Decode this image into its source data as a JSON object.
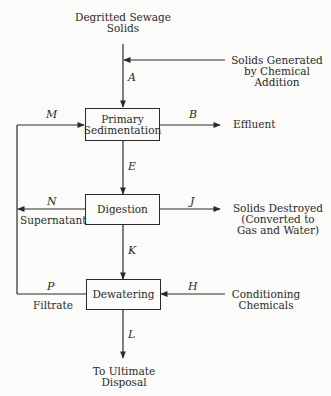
{
  "diagram": {
    "type": "process-flow",
    "inputs": {
      "sewage_solids": [
        "Degritted Sewage",
        "Solids"
      ],
      "chemical_solids": [
        "Solids Generated",
        "by Chemical",
        "Addition"
      ],
      "conditioning": [
        "Conditioning",
        "Chemicals"
      ]
    },
    "processes": {
      "primary_sedimentation": [
        "Primary",
        "Sedimentation"
      ],
      "digestion": "Digestion",
      "dewatering": "Dewatering"
    },
    "outputs": {
      "effluent": "Effluent",
      "solids_destroyed": [
        "Solids Destroyed",
        "(Converted to",
        "Gas and Water)"
      ],
      "disposal": [
        "To Ultimate",
        "Disposal"
      ]
    },
    "side_streams": {
      "supernatant": "Supernatant",
      "filtrate": "Filtrate"
    },
    "flow_labels": {
      "A": "A",
      "B": "B",
      "E": "E",
      "J": "J",
      "K": "K",
      "L": "L",
      "H": "H",
      "M": "M",
      "N": "N",
      "P": "P"
    },
    "edges": [
      {
        "label": "A",
        "from": "Degritted Sewage Solids + Solids Generated by Chemical Addition",
        "to": "Primary Sedimentation"
      },
      {
        "label": "B",
        "from": "Primary Sedimentation",
        "to": "Effluent"
      },
      {
        "label": "E",
        "from": "Primary Sedimentation",
        "to": "Digestion"
      },
      {
        "label": "J",
        "from": "Digestion",
        "to": "Solids Destroyed"
      },
      {
        "label": "N",
        "from": "Digestion",
        "to": "Recycle (Supernatant)"
      },
      {
        "label": "K",
        "from": "Digestion",
        "to": "Dewatering"
      },
      {
        "label": "H",
        "from": "Conditioning Chemicals",
        "to": "Dewatering"
      },
      {
        "label": "P",
        "from": "Dewatering",
        "to": "Recycle (Filtrate)"
      },
      {
        "label": "M",
        "from": "Recycle",
        "to": "Primary Sedimentation"
      },
      {
        "label": "L",
        "from": "Dewatering",
        "to": "To Ultimate Disposal"
      }
    ]
  }
}
